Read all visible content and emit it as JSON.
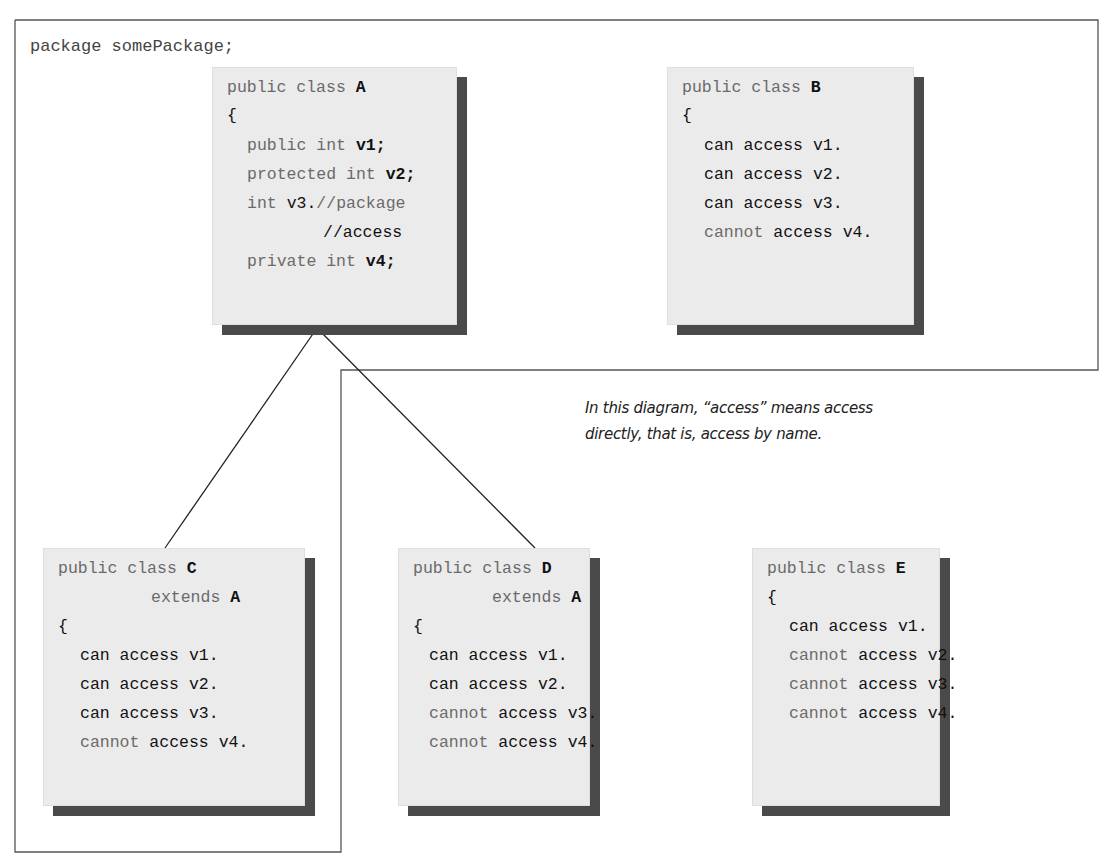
{
  "package_declaration": "package somePackage;",
  "caption": {
    "line1": "In this diagram, “access” means access",
    "line2": "directly, that is, access by name."
  },
  "class_a": {
    "header_kw": "public class",
    "name": "A",
    "open_brace": "{",
    "members": [
      {
        "modifier": "public int",
        "var": "v1;"
      },
      {
        "modifier": "protected int",
        "var": "v2;"
      },
      {
        "modifier": "int",
        "var": "v3.",
        "comment": "//package"
      },
      {
        "comment": "//access"
      },
      {
        "modifier": "private int",
        "var": "v4;"
      }
    ]
  },
  "class_b": {
    "header_kw": "public class",
    "name": "B",
    "open_brace": "{",
    "rows": [
      {
        "neg": "",
        "text": "can access v1."
      },
      {
        "neg": "",
        "text": "can access v2."
      },
      {
        "neg": "",
        "text": "can access v3."
      },
      {
        "neg": "cannot",
        "text": "access v4."
      }
    ]
  },
  "class_c": {
    "header_kw": "public class",
    "name": "C",
    "extends_kw": "extends",
    "extends_name": "A",
    "open_brace": "{",
    "rows": [
      {
        "neg": "",
        "text": "can access v1."
      },
      {
        "neg": "",
        "text": "can access v2."
      },
      {
        "neg": "",
        "text": "can access v3."
      },
      {
        "neg": "cannot",
        "text": "access v4."
      }
    ]
  },
  "class_d": {
    "header_kw": "public class",
    "name": "D",
    "extends_kw": "extends",
    "extends_name": "A",
    "open_brace": "{",
    "rows": [
      {
        "neg": "",
        "text": "can access v1."
      },
      {
        "neg": "",
        "text": "can access v2."
      },
      {
        "neg": "cannot",
        "text": "access v3."
      },
      {
        "neg": "cannot",
        "text": "access v4."
      }
    ]
  },
  "class_e": {
    "header_kw": "public class",
    "name": "E",
    "open_brace": "{",
    "rows": [
      {
        "neg": "",
        "text": "can access v1."
      },
      {
        "neg": "cannot",
        "text": "access v2."
      },
      {
        "neg": "cannot",
        "text": "access v3."
      },
      {
        "neg": "cannot",
        "text": "access v4."
      }
    ]
  }
}
